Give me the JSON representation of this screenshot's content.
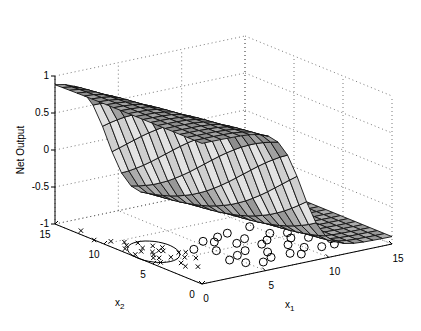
{
  "chart_data": {
    "type": "surface3d",
    "title": "",
    "xlabel": "x1",
    "ylabel": "x2",
    "zlabel": "Net Output",
    "x_ticks": [
      "0",
      "5",
      "10",
      "15"
    ],
    "y_ticks": [
      "0",
      "5",
      "10",
      "15"
    ],
    "z_ticks": [
      "1",
      "0.5",
      "0",
      "-0.5",
      "-1"
    ],
    "xlim": [
      0,
      15
    ],
    "ylim": [
      0,
      15
    ],
    "zlim": [
      -1,
      1
    ],
    "grid": true,
    "surface": {
      "description": "Sigmoid-like network output surface over x1,x2 in [0,15]; high (~0.9) for small x1, drops to (~-0.9) for large x1; transition near x1≈5-7",
      "high_value": 0.9,
      "low_value": -0.9,
      "transition_x1": 6,
      "mesh_lines": 20
    },
    "series": [
      {
        "name": "class-x",
        "marker": "x",
        "description": "cluster at z=-1 plane, centered near x1≈1, x2≈7",
        "points": [
          [
            0.5,
            13
          ],
          [
            0,
            11
          ],
          [
            1,
            9
          ],
          [
            1.5,
            8
          ],
          [
            2,
            7
          ],
          [
            1,
            7.5
          ],
          [
            0.5,
            8.5
          ],
          [
            1.2,
            6.5
          ],
          [
            1.8,
            5.5
          ],
          [
            2.5,
            5
          ],
          [
            0.8,
            6
          ],
          [
            1.5,
            7
          ],
          [
            2.2,
            6.8
          ],
          [
            0.3,
            7.2
          ],
          [
            1.1,
            5.8
          ],
          [
            2.8,
            6
          ],
          [
            3,
            4.5
          ],
          [
            1.6,
            4.2
          ],
          [
            0.6,
            5
          ],
          [
            2.3,
            8
          ],
          [
            1.9,
            9
          ],
          [
            1.3,
            9.6
          ],
          [
            0.7,
            10.2
          ],
          [
            3.2,
            5.8
          ],
          [
            2.6,
            7.4
          ],
          [
            1.4,
            3.5
          ],
          [
            2,
            3
          ]
        ]
      },
      {
        "name": "class-o",
        "marker": "o",
        "description": "cluster at z=-1 plane spread over x1≈3-13, x2≈1-8",
        "points": [
          [
            4,
            6
          ],
          [
            5,
            5
          ],
          [
            5.5,
            3.5
          ],
          [
            6,
            6.5
          ],
          [
            4.5,
            3
          ],
          [
            6.5,
            4
          ],
          [
            7,
            5.5
          ],
          [
            7.5,
            3
          ],
          [
            8,
            6
          ],
          [
            8.2,
            4.5
          ],
          [
            9,
            5
          ],
          [
            9.5,
            3.5
          ],
          [
            10,
            6
          ],
          [
            10.5,
            4.5
          ],
          [
            11,
            5.5
          ],
          [
            11.5,
            4
          ],
          [
            12,
            6.5
          ],
          [
            12.5,
            3
          ],
          [
            13,
            5
          ],
          [
            8.5,
            2
          ],
          [
            9,
            1.5
          ],
          [
            7,
            2
          ],
          [
            6,
            1.5
          ],
          [
            5,
            2
          ],
          [
            10,
            2.5
          ],
          [
            11,
            2
          ],
          [
            12,
            2
          ],
          [
            13.5,
            3.5
          ],
          [
            7.8,
            7.5
          ],
          [
            9.8,
            7.8
          ],
          [
            6.8,
            7.2
          ],
          [
            5.5,
            7
          ]
        ]
      },
      {
        "name": "ellipse",
        "marker": "line",
        "description": "decision contour ellipse around x-cluster at z=-1"
      }
    ]
  },
  "labels": {
    "zlabel": "Net Output",
    "xlabel_main": "x",
    "xlabel_sub": "1",
    "ylabel_main": "x",
    "ylabel_sub": "2"
  }
}
